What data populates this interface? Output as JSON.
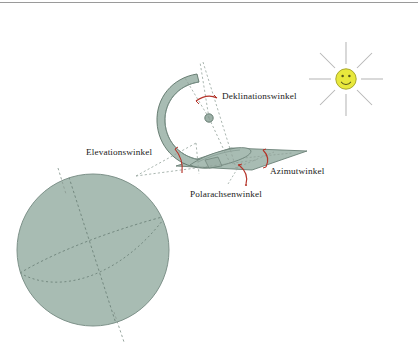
{
  "figure": {
    "language": "de",
    "background_color": "#ffffff",
    "top_rule_color": "#9a9a9a"
  },
  "palette": {
    "body_fill": "#a8bcb3",
    "body_stroke": "#5d7469",
    "plane_fill": "#a8bcb3",
    "plane_stroke": "#6a8076",
    "globe_fill": "#a8bcb3",
    "globe_stroke": "#7d9189",
    "dashed_guide": "#8d9d95",
    "angle_arc": "#b5342a",
    "sun_face": "#e8e83c",
    "sun_face_stroke": "#a9a92a",
    "sun_features": "#555500",
    "sun_ray": "#b6b6b6",
    "node_fill": "#9db1a8",
    "node_stroke": "#5d7469",
    "label_color": "#1a1a1a"
  },
  "labels": {
    "declination": "Deklinationswinkel",
    "elevation": "Elevationswinkel",
    "azimuth": "Azimutwinkel",
    "polar_axis": "Polarachsenwinkel"
  },
  "label_positions": {
    "declination": {
      "x": 222,
      "y": 92
    },
    "elevation": {
      "x": 86,
      "y": 148
    },
    "azimuth": {
      "x": 270,
      "y": 167
    },
    "polar_axis": {
      "x": 190,
      "y": 190
    }
  },
  "elements": {
    "sun": {
      "name": "sun-smiley",
      "center": {
        "x": 346,
        "y": 79
      },
      "face_radius": 10.5,
      "ray_count": 8,
      "ray_inner": 15,
      "ray_outer": 37,
      "has_smile": true,
      "eye_count": 2
    },
    "globe": {
      "name": "earth-globe",
      "center": {
        "x": 93,
        "y": 250
      },
      "radius": 76,
      "polar_axis_tilt_deg": 18,
      "has_equator_curve": true,
      "has_orbit_curve": true
    },
    "collector": {
      "name": "parabolic-collector-arc",
      "opening": "right",
      "focus_node": {
        "x": 209,
        "y": 118
      },
      "band_width": 9
    },
    "ground_plane": {
      "name": "ground-plane-parallelogram",
      "corners": [
        {
          "x": 178,
          "y": 165
        },
        {
          "x": 233,
          "y": 149
        },
        {
          "x": 305,
          "y": 152
        },
        {
          "x": 250,
          "y": 168
        }
      ]
    },
    "angle_arcs": [
      {
        "name": "declination-angle-arc",
        "label_key": "declination"
      },
      {
        "name": "elevation-angle-arc",
        "label_key": "elevation"
      },
      {
        "name": "azimuth-angle-arc",
        "label_key": "azimuth"
      },
      {
        "name": "polar-axis-angle-arc",
        "label_key": "polar_axis"
      }
    ]
  }
}
